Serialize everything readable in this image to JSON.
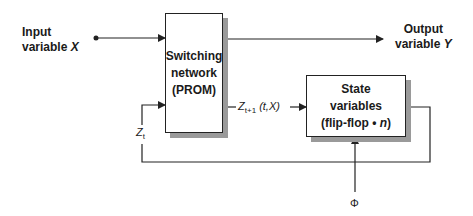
{
  "diagram": {
    "input": {
      "line1": "Input",
      "line2": "variable",
      "var": "X"
    },
    "output": {
      "line1": "Output",
      "line2": "variable",
      "var": "Y"
    },
    "switching_network": {
      "line1": "Switching",
      "line2": "network",
      "line3": "(PROM)"
    },
    "state_variables": {
      "line1": "State",
      "line2": "variables",
      "line3_prefix": "(flip-flop • ",
      "line3_var": "n",
      "line3_suffix": ")"
    },
    "next_state_label": {
      "z": "Z",
      "sub": "t+1",
      "args": " (t,X)"
    },
    "current_state_label": {
      "z": "Z",
      "sub": "t"
    },
    "clock_label": "Φ",
    "colors": {
      "line": "#222222",
      "shadow": "#9a9a9a"
    }
  }
}
